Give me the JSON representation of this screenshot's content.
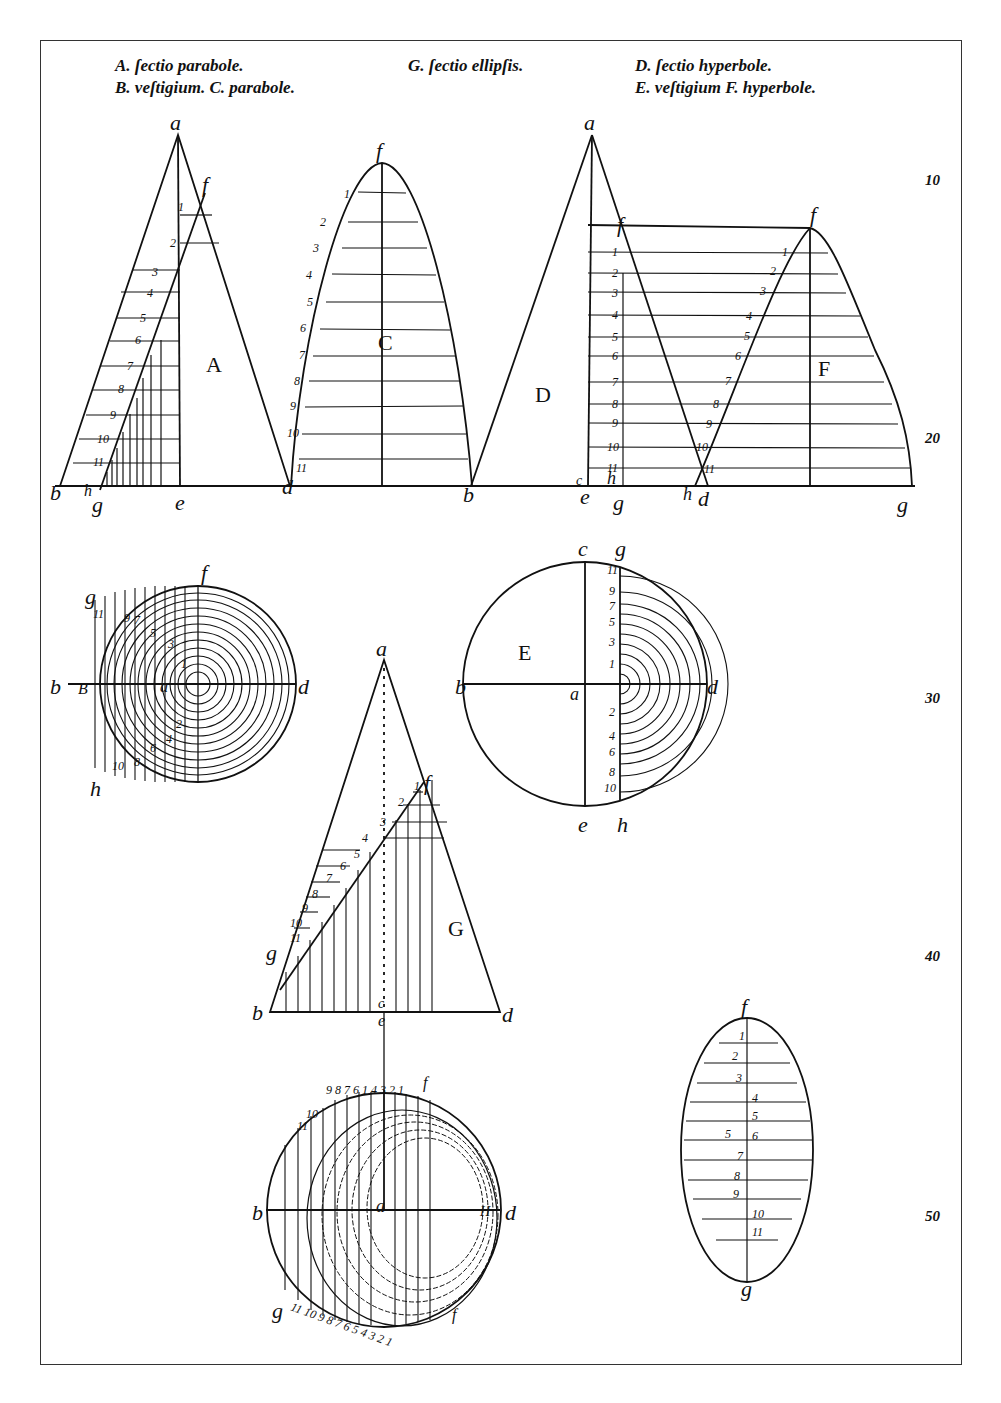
{
  "plate": {
    "captions": {
      "line1_left": "A. ſectio parabole.",
      "line2_left": "B. veſtigium. C. parabole.",
      "line1_mid": "G. ſectio ellipſis.",
      "line1_right": "D. ſectio hyperbole.",
      "line2_right": "E. veſtigium F. hyperbole."
    },
    "margin_numbers": [
      "10",
      "20",
      "30",
      "40",
      "50"
    ],
    "figures": {
      "parabola_cone": {
        "label": "A",
        "points": [
          "a",
          "f",
          "b",
          "h",
          "g",
          "e",
          "d"
        ],
        "numbers": [
          "1",
          "2",
          "3",
          "4",
          "5",
          "6",
          "7",
          "8",
          "9",
          "10",
          "11"
        ]
      },
      "parabola": {
        "label": "C",
        "points": [
          "f",
          "d",
          "b"
        ],
        "numbers": [
          "1",
          "2",
          "3",
          "4",
          "5",
          "6",
          "7",
          "8",
          "9",
          "10",
          "11"
        ]
      },
      "hyperbola_cone": {
        "label": "D",
        "points": [
          "a",
          "f",
          "b",
          "c",
          "e",
          "h",
          "g",
          "d"
        ],
        "numbers": [
          "1",
          "2",
          "3",
          "4",
          "5",
          "6",
          "7",
          "8",
          "9",
          "10",
          "11"
        ]
      },
      "hyperbola": {
        "label": "F",
        "points": [
          "f",
          "h",
          "d",
          "g"
        ],
        "numbers": [
          "1",
          "2",
          "3",
          "4",
          "5",
          "6",
          "7",
          "8",
          "9",
          "10",
          "11"
        ]
      },
      "parabola_footprint": {
        "label": "B",
        "points": [
          "f",
          "g",
          "b",
          "B",
          "a",
          "d",
          "h"
        ],
        "numbers": [
          "11",
          "9",
          "7",
          "5",
          "3",
          "1",
          "2",
          "4",
          "6",
          "8",
          "10"
        ]
      },
      "hyperbola_footprint": {
        "label": "E",
        "points": [
          "c",
          "g",
          "b",
          "a",
          "d",
          "e",
          "h"
        ],
        "numbers_top": [
          "11",
          "9",
          "7",
          "5",
          "3",
          "1"
        ],
        "numbers_bottom": [
          "2",
          "4",
          "6",
          "8",
          "10"
        ]
      },
      "ellipse_cone": {
        "label": "G",
        "points": [
          "a",
          "f",
          "g",
          "b",
          "c",
          "e",
          "d"
        ],
        "numbers": [
          "1",
          "2",
          "3",
          "4",
          "5",
          "6",
          "7",
          "8",
          "9",
          "10",
          "11"
        ]
      },
      "ellipse_footprint": {
        "points": [
          "b",
          "a",
          "d",
          "f",
          "g",
          "H"
        ],
        "numbers_top": "9 8 7 6 1 3 2 1 f",
        "numbers_bottom": "g 11 10 9 8 7 6 5 4 3 2 1 f"
      },
      "ellipse": {
        "points": [
          "f",
          "g"
        ],
        "numbers": [
          "1",
          "2",
          "3",
          "4",
          "5",
          "6",
          "7",
          "8",
          "9",
          "10",
          "11"
        ]
      }
    }
  }
}
